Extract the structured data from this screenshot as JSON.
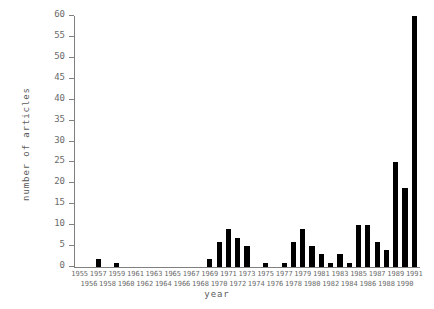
{
  "chart_data": {
    "type": "bar",
    "title": "",
    "subtitle": "",
    "xlabel": "year",
    "ylabel": "number of articles",
    "grid": false,
    "legend": null,
    "xlim": [
      1954.5,
      1991.5
    ],
    "ylim": [
      0,
      60
    ],
    "yticks": [
      0,
      5,
      10,
      15,
      20,
      25,
      30,
      35,
      40,
      45,
      50,
      55,
      60
    ],
    "ytick_labels": [
      "0",
      "5",
      "10",
      "15",
      "20",
      "25",
      "30",
      "35",
      "40",
      "45",
      "50",
      "55",
      "60"
    ],
    "categories": [
      "1955",
      "1956",
      "1957",
      "1958",
      "1959",
      "1960",
      "1961",
      "1962",
      "1963",
      "1964",
      "1965",
      "1966",
      "1967",
      "1968",
      "1969",
      "1970",
      "1971",
      "1972",
      "1973",
      "1974",
      "1975",
      "1976",
      "1977",
      "1978",
      "1979",
      "1980",
      "1981",
      "1982",
      "1983",
      "1984",
      "1985",
      "1986",
      "1987",
      "1988",
      "1989",
      "1990",
      "1991"
    ],
    "values": [
      0,
      0,
      2,
      0,
      1,
      0,
      0,
      0,
      0,
      0,
      0,
      0,
      0,
      0,
      2,
      6,
      9,
      7,
      5,
      0,
      1,
      0,
      1,
      6,
      9,
      5,
      3,
      1,
      3,
      1,
      10,
      10,
      6,
      4,
      25,
      19,
      60
    ],
    "bar_color": "#000000",
    "axis_color": "#808080",
    "background_color": "#ffffff"
  }
}
